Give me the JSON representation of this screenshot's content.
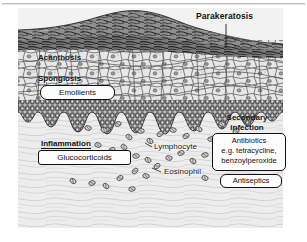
{
  "figure": {
    "kind": "histology-illustration",
    "panel_background": "#f2f2f2",
    "ink_color": "#111111"
  },
  "labels": {
    "parakeratosis": "Parakeratosis",
    "acanthosis": "Acanthosis",
    "spongiosis": "Spongiosis",
    "secondary_infection": "Secondary\ninfection",
    "secondary_infection_line1": "Secondary",
    "secondary_infection_line2": "infection",
    "inflammation": "Inflammation",
    "lymphocyte": "Lymphocyte",
    "eosinophil": "Eosinophil"
  },
  "treatment_boxes": {
    "emollients": "Emollients",
    "glucocorticoids": "Glucocorticoids",
    "antibiotics_line1": "Antibiotics",
    "antibiotics_line2": "e.g. tetracycline,",
    "antibiotics_line3": "benzoylperoxide",
    "antiseptics": "Antiseptics"
  },
  "layers": {
    "stratum_corneum": "hyperkeratotic scale crust",
    "epidermis": "thickened keratinocyte layer",
    "basal_layer": "rete ridges / basal cells",
    "dermis": "collagen fibres with inflammatory cell infiltrate"
  },
  "icons": {
    "leader_line": "leader-line",
    "inflammatory_cell": "oval-cell-glyph"
  }
}
